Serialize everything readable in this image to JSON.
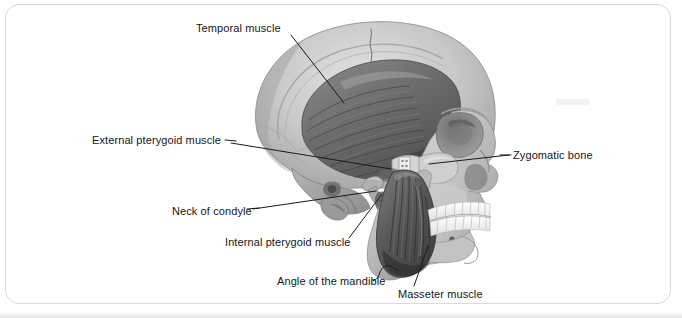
{
  "figure": {
    "kind": "anatomical-illustration",
    "view": "left lateral",
    "style": "grayscale medical illustration on white page",
    "page_border_color": "#d9dadc",
    "label_text_color": "#161616",
    "leader_line_color": "#1a1a1a"
  },
  "labels": {
    "temporal_muscle": "Temporal muscle",
    "external_pterygoid_muscle": "External pterygoid muscle",
    "zygomatic_bone": "Zygomatic bone",
    "neck_of_condyle": "Neck of condyle",
    "internal_pterygoid_muscle": "Internal pterygoid muscle",
    "angle_of_the_mandible": "Angle of the mandible",
    "masseter_muscle": "Masseter muscle"
  },
  "callouts": [
    {
      "id": "temporal-muscle",
      "label": "Temporal muscle",
      "side": "left",
      "text_anchor": {
        "x": 196,
        "y": 28
      },
      "leader_from": {
        "x": 291,
        "y": 36
      },
      "leader_to": {
        "x": 344,
        "y": 103
      },
      "points_at": "fan-shaped temporalis muscle filling the temporal fossa"
    },
    {
      "id": "external-pterygoid-muscle",
      "label": "External pterygoid muscle",
      "side": "left",
      "text_anchor": {
        "x": 92,
        "y": 140
      },
      "leader_from": {
        "x": 230,
        "y": 144
      },
      "leader_to": {
        "x": 391,
        "y": 168
      },
      "points_at": "lateral pterygoid above the condyle"
    },
    {
      "id": "zygomatic-bone",
      "label": "Zygomatic bone",
      "side": "right",
      "text_anchor": {
        "x": 513,
        "y": 155
      },
      "leader_from": {
        "x": 508,
        "y": 155
      },
      "leader_to": {
        "x": 430,
        "y": 164
      },
      "points_at": "cheek bone / zygomatic arch"
    },
    {
      "id": "neck-of-condyle",
      "label": "Neck of condyle",
      "side": "left",
      "text_anchor": {
        "x": 172,
        "y": 211
      },
      "leader_from": {
        "x": 252,
        "y": 209
      },
      "leader_to": {
        "x": 376,
        "y": 191
      },
      "points_at": "narrow neck below the mandibular condyle"
    },
    {
      "id": "internal-pterygoid-muscle",
      "label": "Internal pterygoid muscle",
      "side": "left",
      "text_anchor": {
        "x": 225,
        "y": 242
      },
      "leader_from": {
        "x": 349,
        "y": 239
      },
      "leader_to": {
        "x": 381,
        "y": 193
      },
      "points_at": "medial pterygoid on the inner ramus of the mandible"
    },
    {
      "id": "angle-of-the-mandible",
      "label": "Angle of the mandible",
      "side": "left",
      "text_anchor": {
        "x": 277,
        "y": 281
      },
      "leader_from": {
        "x": 383,
        "y": 277
      },
      "leader_to": {
        "x": 392,
        "y": 268
      },
      "bracket": true,
      "points_at": "posterior-inferior corner of the mandible"
    },
    {
      "id": "masseter-muscle",
      "label": "Masseter muscle",
      "side": "right",
      "text_anchor": {
        "x": 398,
        "y": 294
      },
      "leader_from": {
        "x": 415,
        "y": 285
      },
      "leader_to": {
        "x": 428,
        "y": 245
      },
      "points_at": "striated masseter over the ramus of the mandible"
    }
  ],
  "anatomy_parts": [
    {
      "name": "cranium",
      "tone": "#b9b9b9"
    },
    {
      "name": "temporalis-muscle",
      "tone": "#6a6a6a"
    },
    {
      "name": "zygomatic-arch",
      "tone": "#cdcdcd"
    },
    {
      "name": "orbit",
      "tone": "#8a8a8a"
    },
    {
      "name": "nasal-aperture",
      "tone": "#9a9a9a"
    },
    {
      "name": "maxilla",
      "tone": "#c6c6c6"
    },
    {
      "name": "mandible",
      "tone": "#c2c2c2"
    },
    {
      "name": "masseter-muscle",
      "tone": "#5d5d5d"
    },
    {
      "name": "upper-teeth",
      "tone": "#f3f3f0"
    },
    {
      "name": "lower-teeth",
      "tone": "#f0f0ed"
    },
    {
      "name": "mastoid-process",
      "tone": "#8f8f8f"
    },
    {
      "name": "condyle",
      "tone": "#9d9d9d"
    }
  ]
}
